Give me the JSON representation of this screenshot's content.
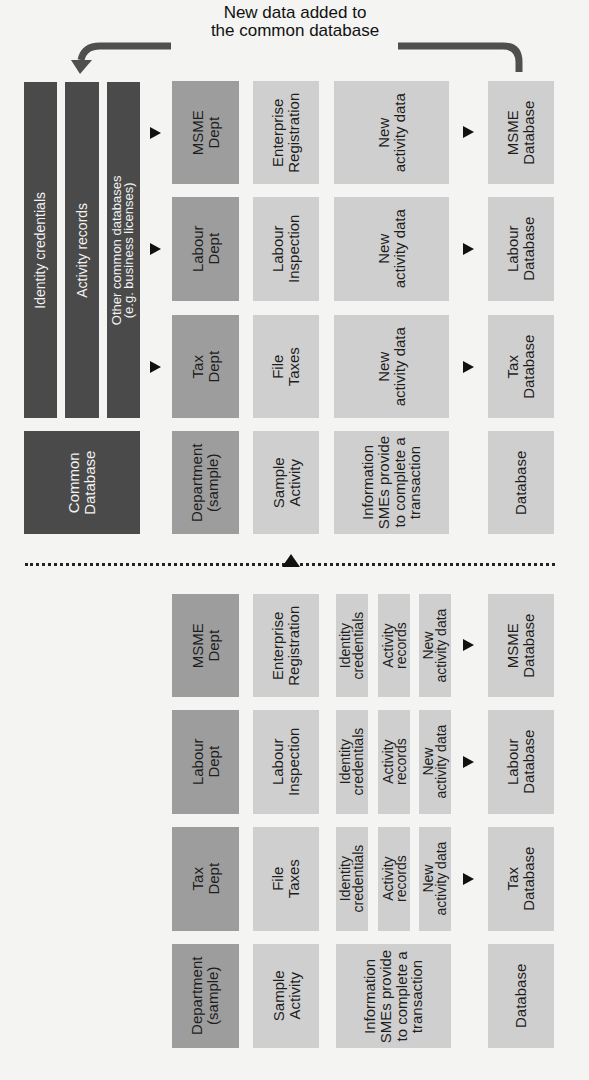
{
  "title": "New data added to\nthe common database",
  "colors": {
    "dark": "#4a4a4a",
    "department": "#9d9d9d",
    "light": "#cfcfcf",
    "background": "#f4f4f2"
  },
  "top_section": {
    "common_database": {
      "label": "Common\nDatabase",
      "bars": [
        "Identity credentials",
        "Activity records",
        "Other common databases\n(e.g. business licenses)"
      ]
    },
    "rows": [
      {
        "department": "MSME\nDept",
        "activity": "Enterprise\nRegistration",
        "information": "New\nactivity data",
        "database": "MSME\nDatabase"
      },
      {
        "department": "Labour\nDept",
        "activity": "Labour\nInspection",
        "information": "New\nactivity data",
        "database": "Labour\nDatabase"
      },
      {
        "department": "Tax\nDept",
        "activity": "File\nTaxes",
        "information": "New\nactivity data",
        "database": "Tax\nDatabase"
      }
    ],
    "header": {
      "department": "Department\n(sample)",
      "activity": "Sample\nActivity",
      "information": "Information\nSMEs provide\nto complete a\ntransaction",
      "database": "Database"
    }
  },
  "bottom_section": {
    "rows": [
      {
        "department": "MSME\nDept",
        "activity": "Enterprise\nRegistration",
        "info": [
          "Identity\ncredentials",
          "Activity\nrecords",
          "New\nactivity data"
        ],
        "database": "MSME\nDatabase"
      },
      {
        "department": "Labour\nDept",
        "activity": "Labour\nInspection",
        "info": [
          "Identity\ncredentials",
          "Activity\nrecords",
          "New\nactivity data"
        ],
        "database": "Labour\nDatabase"
      },
      {
        "department": "Tax\nDept",
        "activity": "File\nTaxes",
        "info": [
          "Identity\ncredentials",
          "Activity\nrecords",
          "New\nactivity data"
        ],
        "database": "Tax\nDatabase"
      }
    ],
    "header": {
      "department": "Department\n(sample)",
      "activity": "Sample\nActivity",
      "information": "Information\nSMEs provide\nto complete a\ntransaction",
      "database": "Database"
    }
  }
}
